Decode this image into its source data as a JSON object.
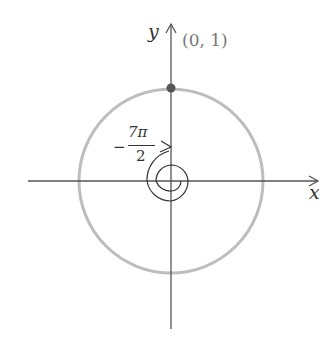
{
  "diagram": {
    "type": "unit-circle-angle",
    "axes": {
      "x_label": "x",
      "y_label": "y"
    },
    "point": {
      "label": "(0, 1)",
      "x": 0,
      "y": 1
    },
    "angle": {
      "numerator": "7π",
      "denominator": "2",
      "sign": "−",
      "value": "-7π/2",
      "direction": "clockwise"
    },
    "colors": {
      "axis": "#555555",
      "circle": "#bbbbbb",
      "spiral": "#333333",
      "point": "#555555",
      "point_label": "#777777"
    }
  }
}
